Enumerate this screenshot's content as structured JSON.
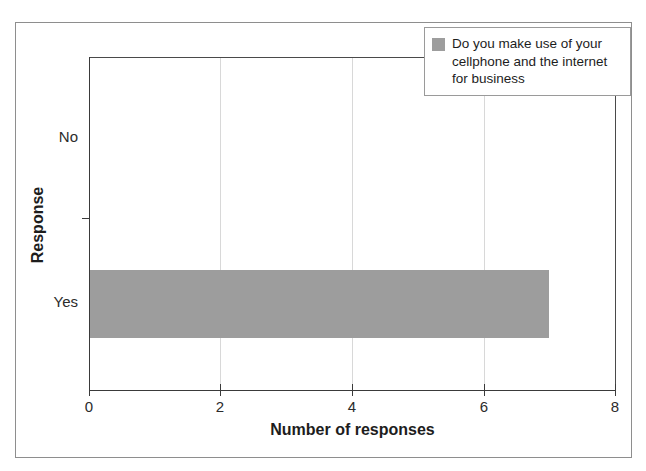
{
  "chart_data": {
    "type": "bar",
    "orientation": "horizontal",
    "title": "",
    "xlabel": "Number of responses",
    "ylabel": "Response",
    "categories": [
      "No",
      "Yes"
    ],
    "values": [
      0,
      7
    ],
    "series": [
      {
        "name": "Do you make use of your cellphone and the internet for business",
        "values": [
          0,
          7
        ],
        "color": "#9d9d9d"
      }
    ],
    "xlim": [
      0,
      8
    ],
    "xticks": [
      0,
      2,
      4,
      6,
      8
    ],
    "xtick_labels": [
      "0",
      "2",
      "4",
      "6",
      "8"
    ],
    "ytick_labels": [
      "No",
      "Yes"
    ],
    "grid": "vertical",
    "legend_position": "top-right",
    "legend_entries": [
      {
        "label": "Do you make use of your\ncellphone and the internet\nfor business",
        "swatch_color": "#9d9d9d"
      }
    ],
    "frame": true,
    "background": "#ffffff"
  },
  "axes": {
    "x_title": "Number of responses",
    "y_title": "Response",
    "x_ticks": [
      {
        "label": "0",
        "value": 0
      },
      {
        "label": "2",
        "value": 2
      },
      {
        "label": "4",
        "value": 4
      },
      {
        "label": "6",
        "value": 6
      },
      {
        "label": "8",
        "value": 8
      }
    ],
    "y_ticks": [
      {
        "label": "No",
        "value": 0
      },
      {
        "label": "Yes",
        "value": 7
      }
    ]
  },
  "legend": {
    "entry_label": "Do you make use of your\ncellphone and the internet\nfor business",
    "swatch_color": "#9d9d9d"
  },
  "colors": {
    "bar": "#9d9d9d",
    "axis": "#3a3a3a",
    "grid": "#d8d8d8",
    "frame": "#8e8e8e",
    "text": "#1d1d1d",
    "background": "#ffffff"
  }
}
